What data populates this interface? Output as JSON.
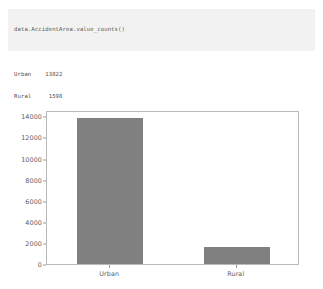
{
  "notebook": {
    "cell_1": {
      "code": "data.AccidentArea.value_counts()"
    },
    "output_1": {
      "line_1": "Urban    13822",
      "line_2": "Rural     1598",
      "line_3": "Name: AccidentArea, dtype: int64"
    },
    "cell_2": {
      "line_1": "import matplotlib.pyplot as plt",
      "line_2": "plt.figure(figsize=(10,6))",
      "line_3": "data[\"AccidentArea\"].value_counts().plot(kind=\"bar\")",
      "line_4": "plt.xticks(rotation = 0);"
    }
  },
  "colors": {
    "bar": "#808080",
    "cell_background": "#f2f2f2",
    "axis": "#b9b9b9",
    "text": "#5a5a5a"
  },
  "chart_data": {
    "type": "bar",
    "title": "",
    "xlabel": "",
    "ylabel": "",
    "categories": [
      "Urban",
      "Rural"
    ],
    "values": [
      13822,
      1598
    ],
    "ylim": [
      0,
      14600
    ],
    "yticks": [
      0,
      2000,
      4000,
      6000,
      8000,
      10000,
      12000,
      14000
    ],
    "ytick_labels": [
      "0",
      "2000",
      "4000",
      "6000",
      "8000",
      "10000",
      "12000",
      "14000"
    ],
    "grid": false,
    "legend": false,
    "bar_color": "#808080"
  }
}
